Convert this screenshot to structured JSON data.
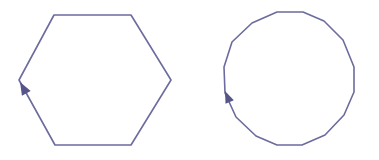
{
  "figure": {
    "stroke_color": "#6b6b9e",
    "arrow_color": "#55558a",
    "background": "#ffffff"
  },
  "shapes": [
    {
      "name": "hexagon",
      "sides": 6,
      "points": [
        [
          54,
          15
        ],
        [
          131,
          15
        ],
        [
          171,
          80
        ],
        [
          131,
          145
        ],
        [
          55,
          145
        ],
        [
          19,
          80
        ]
      ],
      "arrow": {
        "tip": [
          20,
          82
        ],
        "direction": "up-left along lower-left edge"
      }
    },
    {
      "name": "hexadecagon",
      "sides": 16,
      "points": [
        [
          224,
          67
        ],
        [
          232,
          42
        ],
        [
          252,
          23
        ],
        [
          277,
          12
        ],
        [
          303,
          12
        ],
        [
          324,
          21
        ],
        [
          343,
          40
        ],
        [
          354,
          67
        ],
        [
          354,
          92
        ],
        [
          344,
          115
        ],
        [
          325,
          135
        ],
        [
          302,
          145
        ],
        [
          277,
          145
        ],
        [
          256,
          136
        ],
        [
          236,
          117
        ],
        [
          225,
          93
        ]
      ],
      "arrow": {
        "tip": [
          225,
          91
        ],
        "direction": "up along left edge"
      }
    }
  ]
}
